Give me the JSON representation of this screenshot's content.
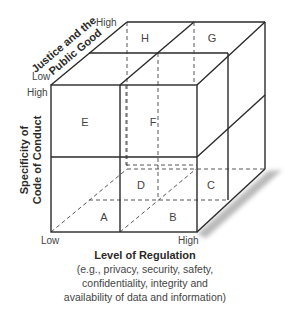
{
  "diagram": {
    "type": "3d-cube-matrix",
    "cells": {
      "A": "A",
      "B": "B",
      "C": "C",
      "D": "D",
      "E": "E",
      "F": "F",
      "G": "G",
      "H": "H"
    },
    "axes": {
      "x": {
        "label": "Level of Regulation",
        "low": "Low",
        "high": "High",
        "description_lines": [
          "(e.g., privacy, security, safety,",
          "confidentiality, integrity and",
          "availability of data and information)"
        ]
      },
      "y": {
        "label_line1": "Specificity of",
        "label_line2": "Code of Conduct",
        "low": "Low",
        "high": "High"
      },
      "z": {
        "label_line1": "Justice and the",
        "label_line2": "Public Good",
        "low": "Low",
        "high": "High"
      }
    },
    "colors": {
      "line": "#2a2a2a",
      "text": "#444444",
      "shadow": "#9a9a9a"
    }
  }
}
